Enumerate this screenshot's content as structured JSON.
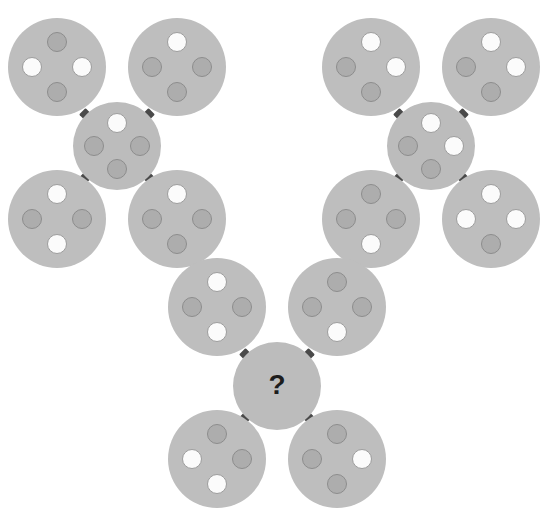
{
  "puzzle": {
    "title": "Circle cluster pattern puzzle",
    "missing_label": "?",
    "colors": {
      "background": "#ffffff",
      "disk": "#bebebe",
      "dot_gray": "#adadad",
      "dot_gray_border": "#8d8d8d",
      "dot_white": "#fbfbfb",
      "dot_white_border": "#9d9d9d",
      "connector": "#4a4a4a",
      "question_text": "#1d1d1d"
    },
    "geometry": {
      "outer_diameter": 98,
      "center_diameter": 88,
      "dot_diameter": 20,
      "connector_size": 9
    },
    "clusters": [
      {
        "name": "cluster-top-left",
        "x": 8,
        "y": 18,
        "nodes": [
          {
            "name": "node-top-left",
            "position": "top-left",
            "cx": 57,
            "cy": 67,
            "r": 49,
            "dots": {
              "top": "gray",
              "left": "white",
              "right": "white",
              "bottom": "gray"
            }
          },
          {
            "name": "node-top-right",
            "position": "top-right",
            "cx": 177,
            "cy": 67,
            "r": 49,
            "dots": {
              "top": "white",
              "left": "gray",
              "right": "gray",
              "bottom": "gray"
            }
          },
          {
            "name": "node-center",
            "position": "center",
            "cx": 117,
            "cy": 146,
            "r": 44,
            "dots": {
              "top": "white",
              "left": "gray",
              "right": "gray",
              "bottom": "gray"
            }
          },
          {
            "name": "node-bottom-left",
            "position": "bottom-left",
            "cx": 57,
            "cy": 219,
            "r": 49,
            "dots": {
              "top": "white",
              "left": "gray",
              "right": "gray",
              "bottom": "white"
            }
          },
          {
            "name": "node-bottom-right",
            "position": "bottom-right",
            "cx": 177,
            "cy": 219,
            "r": 49,
            "dots": {
              "top": "white",
              "left": "gray",
              "right": "gray",
              "bottom": "gray"
            }
          }
        ]
      },
      {
        "name": "cluster-top-right",
        "x": 322,
        "y": 18,
        "nodes": [
          {
            "name": "node-top-left",
            "position": "top-left",
            "cx": 371,
            "cy": 67,
            "r": 49,
            "dots": {
              "top": "white",
              "left": "gray",
              "right": "white",
              "bottom": "gray"
            }
          },
          {
            "name": "node-top-right",
            "position": "top-right",
            "cx": 491,
            "cy": 67,
            "r": 49,
            "dots": {
              "top": "white",
              "left": "gray",
              "right": "white",
              "bottom": "gray"
            }
          },
          {
            "name": "node-center",
            "position": "center",
            "cx": 431,
            "cy": 146,
            "r": 44,
            "dots": {
              "top": "white",
              "left": "gray",
              "right": "white",
              "bottom": "gray"
            }
          },
          {
            "name": "node-bottom-left",
            "position": "bottom-left",
            "cx": 371,
            "cy": 219,
            "r": 49,
            "dots": {
              "top": "gray",
              "left": "gray",
              "right": "gray",
              "bottom": "white"
            }
          },
          {
            "name": "node-bottom-right",
            "position": "bottom-right",
            "cx": 491,
            "cy": 219,
            "r": 49,
            "dots": {
              "top": "white",
              "left": "white",
              "right": "white",
              "bottom": "gray"
            }
          }
        ]
      },
      {
        "name": "cluster-bottom",
        "x": 168,
        "y": 258,
        "nodes": [
          {
            "name": "node-top-left",
            "position": "top-left",
            "cx": 217,
            "cy": 307,
            "r": 49,
            "dots": {
              "top": "white",
              "left": "gray",
              "right": "gray",
              "bottom": "white"
            }
          },
          {
            "name": "node-top-right",
            "position": "top-right",
            "cx": 337,
            "cy": 307,
            "r": 49,
            "dots": {
              "top": "gray",
              "left": "gray",
              "right": "gray",
              "bottom": "white"
            }
          },
          {
            "name": "node-center",
            "position": "center",
            "cx": 277,
            "cy": 386,
            "r": 44,
            "dots": null,
            "unknown": true,
            "label": "?"
          },
          {
            "name": "node-bottom-left",
            "position": "bottom-left",
            "cx": 217,
            "cy": 459,
            "r": 49,
            "dots": {
              "top": "gray",
              "left": "white",
              "right": "gray",
              "bottom": "white"
            }
          },
          {
            "name": "node-bottom-right",
            "position": "bottom-right",
            "cx": 337,
            "cy": 459,
            "r": 49,
            "dots": {
              "top": "gray",
              "left": "gray",
              "right": "white",
              "bottom": "gray"
            }
          }
        ]
      }
    ]
  }
}
